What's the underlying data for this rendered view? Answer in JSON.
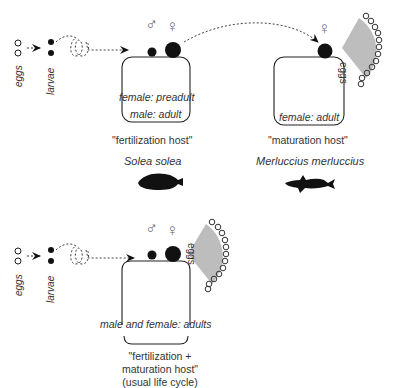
{
  "top_left": {
    "eggs_label": "eggs",
    "larvae_label": "larvae",
    "fertilization_host": {
      "female_stage": "female: preadult",
      "male_stage": "male: adult",
      "caption": "\"fertilization host\"",
      "species": "Solea solea",
      "male_symbol": "♂",
      "female_symbol": "♀"
    },
    "maturation_host": {
      "female_stage": "female: adult",
      "caption": "\"maturation host\"",
      "species": "Merluccius merluccius",
      "female_symbol": "♀",
      "egg_fan_label": "eggs"
    }
  },
  "bottom": {
    "eggs_label": "eggs",
    "larvae_label": "larvae",
    "male_symbol": "♂",
    "female_symbol": "♀",
    "egg_fan_label": "eggs",
    "stage": "male and female: adults",
    "caption_line1": "\"fertilization +",
    "caption_line2": "maturation host\"",
    "caption_line3": "(usual life cycle)"
  },
  "colors": {
    "ink": "#111111",
    "fan_fill": "#bdbdbd",
    "symbol": "#777777"
  }
}
